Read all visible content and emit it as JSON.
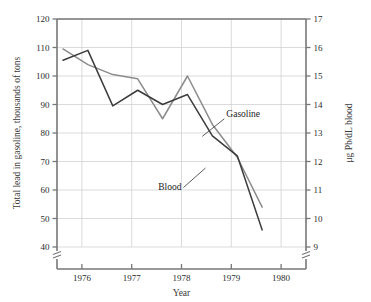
{
  "chart_data": {
    "type": "line",
    "title": "",
    "xlabel": "Year",
    "ylabel": "Total lead in gasoline, thousands of tons",
    "ylabel_right": "μg Pb/dL blood",
    "xlim": [
      1975.5,
      1980.5
    ],
    "ylim": [
      40,
      120
    ],
    "ylim_right": [
      9,
      17
    ],
    "yticks": [
      40,
      50,
      60,
      70,
      80,
      90,
      100,
      110,
      120
    ],
    "yticks_right": [
      9,
      10,
      11,
      12,
      13,
      14,
      15,
      16,
      17
    ],
    "xticks": [
      1976,
      1977,
      1978,
      1979,
      1980
    ],
    "xtick_labels": [
      "1976",
      "1977",
      "1978",
      "1979",
      "1980"
    ],
    "grid": true,
    "legend": "inline-annotations",
    "axis_break_left": true,
    "axis_break_right": true,
    "series": [
      {
        "name": "Gasoline",
        "axis": "left",
        "color": "#8c8c8c",
        "x": [
          1975.62,
          1976.12,
          1976.62,
          1977.12,
          1977.62,
          1978.12,
          1978.62,
          1979.12,
          1979.62
        ],
        "values": [
          109.5,
          104.0,
          100.5,
          99.0,
          85.0,
          100.0,
          83.0,
          71.5,
          54.0
        ]
      },
      {
        "name": "Blood",
        "axis": "right",
        "color": "#3c3c3c",
        "x": [
          1975.62,
          1976.12,
          1976.62,
          1977.12,
          1977.62,
          1978.12,
          1978.62,
          1979.12,
          1979.62
        ],
        "values": [
          15.55,
          15.9,
          13.95,
          14.5,
          14.0,
          14.35,
          12.9,
          12.2,
          9.6
        ]
      }
    ],
    "annotations": [
      {
        "text": "Gasoline",
        "x": 1978.9,
        "y": 13.55
      },
      {
        "text": "Blood",
        "x": 1978.0,
        "y": 11.0
      }
    ]
  }
}
